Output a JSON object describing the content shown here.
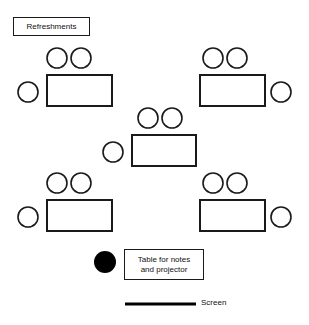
{
  "diagram": {
    "canvas": {
      "width": 309,
      "height": 325,
      "background": "#ffffff"
    },
    "stroke_color": "#1a1a1a",
    "fill_color": "#ffffff",
    "solid_fill_color": "#000000"
  },
  "labels": {
    "refreshments": {
      "text": "Refreshments",
      "x": 13,
      "y": 17,
      "width": 77,
      "height": 19,
      "font_size": 8
    },
    "notes_table": {
      "line1": "Table for notes",
      "line2": "and projector",
      "x": 124,
      "y": 249,
      "width": 80,
      "height": 31,
      "font_size": 8
    },
    "screen": {
      "text": "Screen",
      "x": 201,
      "y": 298,
      "font_size": 8
    }
  },
  "screen_bar": {
    "x1": 125,
    "y1": 304,
    "x2": 196,
    "y2": 304,
    "thickness": 3
  },
  "notes_dot": {
    "cx": 105,
    "cy": 262,
    "r": 11
  },
  "table_groups": [
    {
      "name": "top-left-table",
      "table": {
        "x": 47,
        "y": 75,
        "width": 65,
        "height": 31
      },
      "chairs": [
        {
          "name": "chair-top-left",
          "cx": 57,
          "cy": 58,
          "r": 10
        },
        {
          "name": "chair-top-right",
          "cx": 81,
          "cy": 58,
          "r": 10
        },
        {
          "name": "chair-side-left",
          "cx": 28,
          "cy": 92,
          "r": 10
        }
      ]
    },
    {
      "name": "top-right-table",
      "table": {
        "x": 200,
        "y": 75,
        "width": 65,
        "height": 31
      },
      "chairs": [
        {
          "name": "chair-top-left",
          "cx": 213,
          "cy": 58,
          "r": 10
        },
        {
          "name": "chair-top-right",
          "cx": 237,
          "cy": 58,
          "r": 10
        },
        {
          "name": "chair-side-right",
          "cx": 281,
          "cy": 92,
          "r": 10
        }
      ]
    },
    {
      "name": "center-table",
      "table": {
        "x": 132,
        "y": 135,
        "width": 64,
        "height": 31
      },
      "chairs": [
        {
          "name": "chair-top-left",
          "cx": 148,
          "cy": 118,
          "r": 10
        },
        {
          "name": "chair-top-right",
          "cx": 172,
          "cy": 118,
          "r": 10
        },
        {
          "name": "chair-side-left",
          "cx": 113,
          "cy": 152,
          "r": 10
        }
      ]
    },
    {
      "name": "bottom-left-table",
      "table": {
        "x": 47,
        "y": 200,
        "width": 65,
        "height": 31
      },
      "chairs": [
        {
          "name": "chair-top-left",
          "cx": 57,
          "cy": 183,
          "r": 10
        },
        {
          "name": "chair-top-right",
          "cx": 81,
          "cy": 183,
          "r": 10
        },
        {
          "name": "chair-side-left",
          "cx": 28,
          "cy": 217,
          "r": 10
        }
      ]
    },
    {
      "name": "bottom-right-table",
      "table": {
        "x": 200,
        "y": 200,
        "width": 65,
        "height": 31
      },
      "chairs": [
        {
          "name": "chair-top-left",
          "cx": 213,
          "cy": 183,
          "r": 10
        },
        {
          "name": "chair-top-right",
          "cx": 237,
          "cy": 183,
          "r": 10
        },
        {
          "name": "chair-side-right",
          "cx": 281,
          "cy": 217,
          "r": 10
        }
      ]
    }
  ]
}
